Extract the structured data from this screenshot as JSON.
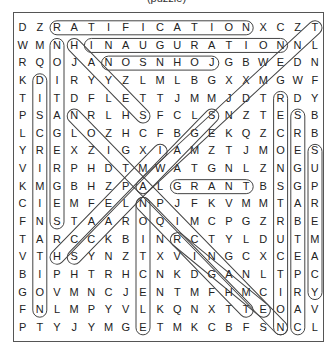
{
  "puzzle": {
    "title": "(puzzle)",
    "rows": [
      "DZRATIFICATIONXCZT",
      "WMNHINAUGURATIONNL",
      "RQOJANOSNHOJGBWEDN",
      "KDIRYYZLMLBGXXMGWF",
      "TITDFLETTJMMJDTRDY",
      "PSANRLHSFCLSNZTESB",
      "LCGLOZHCFBGEKQZCRB",
      "YREXZIGXIAMZTJMOES",
      "VIRPHDTMWATGNLZNGU",
      "KMGBHZPALGRANTBSGP",
      "CIEMFELNPJFKVMMTAR",
      "FNSTAAROQIMCPGZRBE",
      "TARCCKBINRCTYLDUTM",
      "VTHSYNZTXVINGCXCEA",
      "BIPHTRHCNKDGANLTPC",
      "GOVMNCJENTMFHMCIRY",
      "FNLMPYVLKQNXTTEOAV",
      "PTYJYMGETMKCBFSNCL"
    ],
    "found_words": [
      {
        "word": "RATIFICATION",
        "start": [
          0,
          2
        ],
        "end": [
          0,
          13
        ]
      },
      {
        "word": "INAUGURATION",
        "start": [
          1,
          4
        ],
        "end": [
          1,
          15
        ]
      },
      {
        "word": "JOHNSON",
        "start": [
          2,
          11
        ],
        "end": [
          2,
          5
        ]
      },
      {
        "word": "GRANT",
        "start": [
          9,
          9
        ],
        "end": [
          9,
          13
        ]
      },
      {
        "word": "DISCRIMINATION",
        "start": [
          3,
          1
        ],
        "end": [
          16,
          1
        ]
      },
      {
        "word": "SEGREGATION",
        "start": [
          11,
          2
        ],
        "end": [
          1,
          2
        ]
      },
      {
        "word": "ELECTION",
        "start": [
          17,
          7
        ],
        "end": [
          10,
          7
        ]
      },
      {
        "word": "RECONSTRUCTION",
        "start": [
          4,
          15
        ],
        "end": [
          17,
          15
        ]
      },
      {
        "word": "CARPETBAGGERS",
        "start": [
          17,
          16
        ],
        "end": [
          5,
          16
        ]
      },
      {
        "word": "SUPREMACY",
        "start": [
          7,
          17
        ],
        "end": [
          15,
          17
        ]
      },
      {
        "word": "AMENDMENT",
        "start": [
          9,
          7
        ],
        "end": [
          0,
          17
        ]
      },
      {
        "word": "HAYES",
        "start": [
          1,
          3
        ],
        "end": [
          5,
          7
        ]
      },
      {
        "word": "DIAGONAL-1",
        "start": [
          5,
          3
        ],
        "end": [
          17,
          15
        ]
      },
      {
        "word": "DIAGONAL-2",
        "start": [
          12,
          9
        ],
        "end": [
          16,
          14
        ]
      },
      {
        "word": "DIAGONAL-3",
        "start": [
          13,
          3
        ],
        "end": [
          5,
          11
        ]
      },
      {
        "word": "DIAGONAL-4",
        "start": [
          13,
          2
        ],
        "end": [
          7,
          8
        ]
      },
      {
        "word": "DIAGONAL-5",
        "start": [
          10,
          7
        ],
        "end": [
          16,
          13
        ]
      }
    ]
  }
}
